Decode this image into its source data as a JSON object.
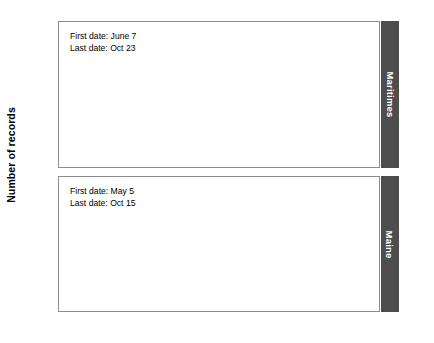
{
  "chart_data": {
    "type": "bar",
    "title": "",
    "xlabel": "",
    "ylabel": "Number of records",
    "ylim": [
      0,
      80
    ],
    "yticks": [
      0,
      20,
      40,
      60,
      80
    ],
    "ytick_labels": [
      "",
      "20",
      "40",
      "60",
      "80"
    ],
    "grid": false,
    "legend_position": "right-strip",
    "x_axis_months": [
      "Mar",
      "Apr",
      "May",
      "Jun",
      "Jul",
      "Aug",
      "Sep",
      "Oct",
      "Nov"
    ],
    "x_range_months": [
      3,
      11
    ],
    "bin": "weekly",
    "panels": [
      {
        "name": "Maritimes",
        "strip_label": "Maritimes",
        "annotations": [
          "First date: June 7",
          "Last date: Oct 23"
        ],
        "first_date": "June 7",
        "last_date": "Oct 23",
        "series": [
          {
            "name": "Number of records",
            "x": [
              "Mar 1",
              "Mar 8",
              "Mar 15",
              "Mar 22",
              "Mar 29",
              "Apr 5",
              "Apr 12",
              "Apr 19",
              "Apr 26",
              "May 3",
              "May 10",
              "May 17",
              "May 24",
              "May 31",
              "Jun 7",
              "Jun 14",
              "Jun 21",
              "Jun 28",
              "Jul 5",
              "Jul 12",
              "Jul 19",
              "Jul 26",
              "Aug 2",
              "Aug 9",
              "Aug 16",
              "Aug 23",
              "Aug 30",
              "Sep 6",
              "Sep 13",
              "Sep 20",
              "Sep 27",
              "Oct 4",
              "Oct 11",
              "Oct 18",
              "Oct 25",
              "Nov 1"
            ],
            "values": [
              0,
              0,
              0,
              0,
              0,
              0,
              0,
              0,
              0,
              0,
              0,
              0,
              0,
              0,
              3,
              3,
              0,
              0,
              0,
              2,
              4,
              2,
              1,
              2,
              6,
              5,
              12,
              17,
              15,
              13,
              10,
              4,
              4,
              3,
              1,
              0
            ]
          }
        ]
      },
      {
        "name": "Maine",
        "strip_label": "Maine",
        "annotations": [
          "First date: May 5",
          "Last date: Oct 15"
        ],
        "first_date": "May 5",
        "last_date": "Oct 15",
        "series": [
          {
            "name": "Number of records",
            "x": [
              "Mar 1",
              "Mar 8",
              "Mar 15",
              "Mar 22",
              "Mar 29",
              "Apr 5",
              "Apr 12",
              "Apr 19",
              "Apr 26",
              "May 3",
              "May 10",
              "May 17",
              "May 24",
              "May 31",
              "Jun 7",
              "Jun 14",
              "Jun 21",
              "Jun 28",
              "Jul 5",
              "Jul 12",
              "Jul 19",
              "Jul 26",
              "Aug 2",
              "Aug 9",
              "Aug 16",
              "Aug 23",
              "Aug 30",
              "Sep 6",
              "Sep 13",
              "Sep 20",
              "Sep 27",
              "Oct 4",
              "Oct 11",
              "Oct 18",
              "Oct 25",
              "Nov 1"
            ],
            "values": [
              0,
              0,
              0,
              0,
              0,
              0,
              0,
              0,
              0,
              2,
              4,
              6,
              15,
              18,
              9,
              10,
              3,
              2,
              9,
              28,
              43,
              34,
              36,
              27,
              26,
              26,
              33,
              56,
              62,
              66,
              45,
              31,
              34,
              14,
              16,
              3
            ]
          }
        ]
      }
    ]
  },
  "ylabel_text": "Number of records"
}
